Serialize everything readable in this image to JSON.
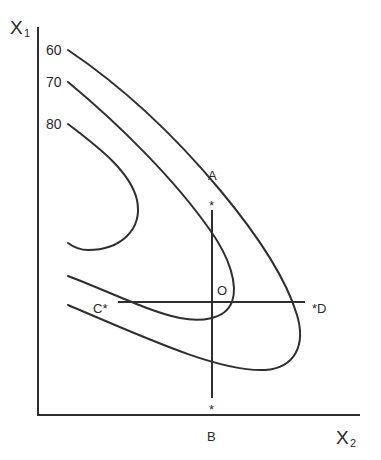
{
  "diagram": {
    "axes": {
      "y_label": "X",
      "y_label_sub": "1",
      "x_label": "X",
      "x_label_sub": "2"
    },
    "contours": [
      {
        "label": "60",
        "level": 60
      },
      {
        "label": "70",
        "level": 70
      },
      {
        "label": "80",
        "level": 80
      }
    ],
    "points": {
      "A": "A",
      "B": "B",
      "C": "C*",
      "D": "*D",
      "O": "O",
      "star": "*"
    },
    "colors": {
      "ink": "#2f2f2f",
      "background": "#ffffff"
    }
  }
}
